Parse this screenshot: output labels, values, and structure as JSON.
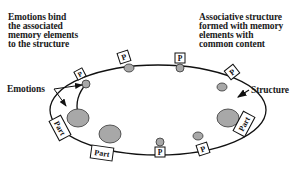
{
  "annotations": {
    "top_left": "Emotions bind\nthe associated\nmemory elements\nto the structure",
    "top_right": "Associative structure\nformed with memory\nelements with\ncommon content",
    "emotions": "Emotions",
    "structure": "Structure"
  },
  "node_labels": {
    "p": "P",
    "part": "Part"
  },
  "colors": {
    "node_fill": "#a8a8a8",
    "stroke": "#111111",
    "background": "#ffffff"
  }
}
